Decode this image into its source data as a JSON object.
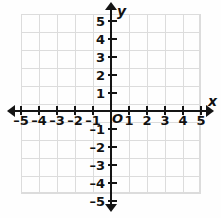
{
  "figure": {
    "kind": "cartesian-coordinate-plane",
    "background_color": "#fefefe",
    "grid_color": "#dcdcdc",
    "axis_color": "#141414",
    "label_color": "#111111",
    "origin_label": "O"
  },
  "chart_data": {
    "type": "scatter",
    "title": "",
    "subtitle": "",
    "xlabel": "x",
    "ylabel": "y",
    "xlim": [
      -5.5,
      5.5
    ],
    "ylim": [
      -5.5,
      5.5
    ],
    "grid": true,
    "grid_step": 1,
    "legend": null,
    "series": [],
    "x_tick_values": [
      -5,
      -4,
      -3,
      -2,
      -1,
      1,
      2,
      3,
      4,
      5
    ],
    "y_tick_values": [
      5,
      4,
      3,
      2,
      1,
      -1,
      -2,
      -3,
      -4,
      -5
    ],
    "x_tick_labels": [
      "–5",
      "–4",
      "–3",
      "–2",
      "–1",
      "1",
      "2",
      "3",
      "4",
      "5"
    ],
    "y_tick_labels": [
      "5",
      "4",
      "3",
      "2",
      "1",
      "–1",
      "–2",
      "–3",
      "–4",
      "–5"
    ],
    "annotations": [
      "O"
    ]
  },
  "axes": {
    "x_name": "x",
    "y_name": "y",
    "origin": "O",
    "x_ticks": [
      {
        "value": -5,
        "label": "–5"
      },
      {
        "value": -4,
        "label": "–4"
      },
      {
        "value": -3,
        "label": "–3"
      },
      {
        "value": -2,
        "label": "–2"
      },
      {
        "value": -1,
        "label": "–1"
      },
      {
        "value": 1,
        "label": "1"
      },
      {
        "value": 2,
        "label": "2"
      },
      {
        "value": 3,
        "label": "3"
      },
      {
        "value": 4,
        "label": "4"
      },
      {
        "value": 5,
        "label": "5"
      }
    ],
    "y_ticks": [
      {
        "value": 5,
        "label": "5"
      },
      {
        "value": 4,
        "label": "4"
      },
      {
        "value": 3,
        "label": "3"
      },
      {
        "value": 2,
        "label": "2"
      },
      {
        "value": 1,
        "label": "1"
      },
      {
        "value": -1,
        "label": "–1"
      },
      {
        "value": -2,
        "label": "–2"
      },
      {
        "value": -3,
        "label": "–3"
      },
      {
        "value": -4,
        "label": "–4"
      },
      {
        "value": -5,
        "label": "–5"
      }
    ]
  }
}
